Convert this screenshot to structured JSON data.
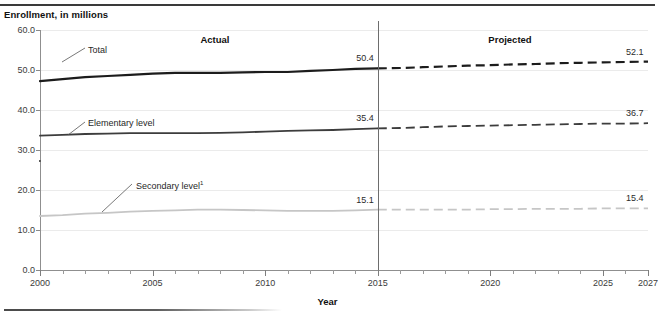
{
  "header": {
    "y_axis_title": "Enrollment, in millions"
  },
  "footer": {
    "x_axis_title": "Year"
  },
  "annotations": {
    "actual_label": "Actual",
    "projected_label": "Projected",
    "divider_year": 2015
  },
  "callouts": [
    {
      "name": "total",
      "text": "Total",
      "note": ""
    },
    {
      "name": "elementary",
      "text": "Elementary level",
      "note": ""
    },
    {
      "name": "secondary",
      "text": "Secondary level",
      "note": "1"
    }
  ],
  "chart_data": {
    "type": "line",
    "title": "",
    "subtitle": "",
    "xlabel": "Year",
    "ylabel": "Enrollment, in millions",
    "xlim": [
      2000,
      2027
    ],
    "ylim": [
      0.0,
      60.0
    ],
    "yticks": [
      "0.0",
      "10.0",
      "20.0",
      "30.0",
      "40.0",
      "50.0",
      "60.0"
    ],
    "ytick_values": [
      0.0,
      10.0,
      20.0,
      30.0,
      40.0,
      50.0,
      60.0
    ],
    "xticks": [
      "2000",
      "2005",
      "2010",
      "2015",
      "2020",
      "2025",
      "2027"
    ],
    "xtick_values": [
      2000,
      2005,
      2010,
      2015,
      2020,
      2025,
      2027
    ],
    "x_minor_tick_values": [
      2001,
      2002,
      2003,
      2004,
      2006,
      2007,
      2008,
      2009,
      2011,
      2012,
      2013,
      2014,
      2016,
      2017,
      2018,
      2019,
      2021,
      2022,
      2023,
      2024,
      2026
    ],
    "grid": true,
    "legend_position": "inline-callouts",
    "split_year": 2015,
    "split_labels": {
      "left": "Actual",
      "right": "Projected"
    },
    "x": [
      2000,
      2001,
      2002,
      2003,
      2004,
      2005,
      2006,
      2007,
      2008,
      2009,
      2010,
      2011,
      2012,
      2013,
      2014,
      2015,
      2016,
      2017,
      2018,
      2019,
      2020,
      2021,
      2022,
      2023,
      2024,
      2025,
      2026,
      2027
    ],
    "series": [
      {
        "name": "Total",
        "color": "#1c1c1c",
        "width": 2.2,
        "values": [
          47.2,
          47.7,
          48.2,
          48.5,
          48.8,
          49.1,
          49.3,
          49.3,
          49.3,
          49.4,
          49.5,
          49.5,
          49.8,
          50.0,
          50.3,
          50.4,
          50.5,
          50.7,
          50.9,
          51.1,
          51.2,
          51.4,
          51.5,
          51.7,
          51.8,
          51.9,
          52.0,
          52.1
        ],
        "labels": {
          "at_split": "50.4",
          "at_end": "52.1"
        }
      },
      {
        "name": "Elementary level",
        "color": "#3d3d3d",
        "width": 1.8,
        "values": [
          33.6,
          33.8,
          34.0,
          34.1,
          34.2,
          34.2,
          34.2,
          34.2,
          34.3,
          34.4,
          34.6,
          34.8,
          34.9,
          35.0,
          35.2,
          35.4,
          35.5,
          35.7,
          35.9,
          36.0,
          36.1,
          36.2,
          36.3,
          36.4,
          36.5,
          36.6,
          36.6,
          36.7
        ],
        "labels": {
          "at_split": "35.4",
          "at_end": "36.7"
        }
      },
      {
        "name": "Secondary level",
        "color": "#c6c6c6",
        "width": 1.8,
        "values": [
          13.5,
          13.7,
          14.1,
          14.3,
          14.6,
          14.8,
          14.9,
          15.1,
          15.1,
          15.0,
          14.9,
          14.8,
          14.8,
          14.8,
          14.9,
          15.1,
          15.1,
          15.1,
          15.1,
          15.1,
          15.2,
          15.2,
          15.3,
          15.3,
          15.3,
          15.4,
          15.4,
          15.4
        ],
        "labels": {
          "at_split": "15.1",
          "at_end": "15.4"
        }
      }
    ]
  }
}
